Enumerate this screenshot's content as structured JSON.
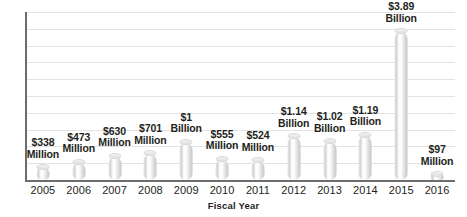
{
  "chart_data": {
    "type": "bar",
    "title": "",
    "subtitle": "",
    "xlabel": "Fiscal Year",
    "ylabel": "",
    "categories": [
      "2005",
      "2006",
      "2007",
      "2008",
      "2009",
      "2010",
      "2011",
      "2012",
      "2013",
      "2014",
      "2015",
      "2016"
    ],
    "values": [
      338,
      473,
      630,
      701,
      1000,
      555,
      524,
      1140,
      1020,
      1190,
      3890,
      97
    ],
    "value_unit": "USD millions",
    "data_labels": [
      {
        "amount": "$338",
        "unit": "Million"
      },
      {
        "amount": "$473",
        "unit": "Million"
      },
      {
        "amount": "$630",
        "unit": "Million"
      },
      {
        "amount": "$701",
        "unit": "Million"
      },
      {
        "amount": "$1",
        "unit": "Billion"
      },
      {
        "amount": "$555",
        "unit": "Million"
      },
      {
        "amount": "$524",
        "unit": "Million"
      },
      {
        "amount": "$1.14",
        "unit": "Billion"
      },
      {
        "amount": "$1.02",
        "unit": "Billion"
      },
      {
        "amount": "$1.19",
        "unit": "Billion"
      },
      {
        "amount": "$3.89",
        "unit": "Billion"
      },
      {
        "amount": "$97",
        "unit": "Million"
      }
    ],
    "ylim": [
      0,
      4400
    ],
    "grid": true,
    "gridline_count": 11,
    "legend": null,
    "legend_position": "none",
    "colors": {
      "bar_light": "#ffffff",
      "bar_mid": "#e0e0e0",
      "bar_dark": "#c4c4c4",
      "gridline": "#e3e3e3",
      "axis": "#6d6d6d",
      "text": "#231f20",
      "background": "#ffffff"
    }
  }
}
